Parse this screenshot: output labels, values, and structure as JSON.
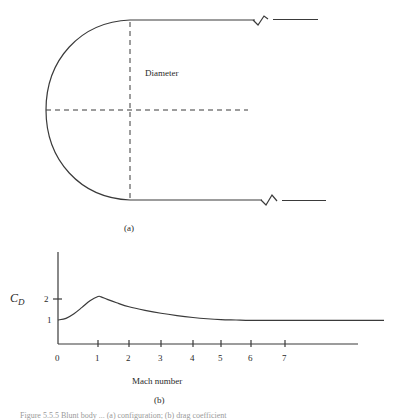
{
  "figure": {
    "panel_a": {
      "label": "(a)",
      "diameter_label": "Diameter",
      "shape": "blunt hemispherical nose cylinder with broken (truncated) afterbody lines"
    },
    "panel_b": {
      "label": "(b)"
    },
    "caption_partial": "Figure 5.5.5 Blunt body ... (a) configuration; (b) drag coefficient"
  },
  "chart_data": {
    "type": "line",
    "title": "",
    "xlabel": "Mach number",
    "ylabel": "C_D",
    "ylabel_main": "C",
    "ylabel_sub": "D",
    "xlim": [
      0,
      10
    ],
    "ylim": [
      0,
      3.2
    ],
    "grid": false,
    "x_ticks": [
      0,
      1,
      2,
      3,
      4,
      5,
      6,
      7
    ],
    "x_tick_labels": [
      "0",
      "1",
      "2",
      "3",
      "4",
      "5",
      "6",
      "7"
    ],
    "y_ticks": [
      1,
      2
    ],
    "y_tick_labels": [
      "1",
      "2"
    ],
    "series": [
      {
        "name": "C_D vs Mach",
        "x": [
          0,
          0.2,
          0.4,
          0.6,
          0.8,
          1.0,
          1.1,
          1.3,
          1.6,
          2.0,
          2.5,
          3.0,
          3.5,
          4.0,
          4.5,
          5.0,
          5.5,
          6.0,
          7.0,
          8.0,
          9.0,
          10.0
        ],
        "y": [
          1.0,
          1.08,
          1.3,
          1.6,
          1.92,
          2.12,
          2.1,
          1.98,
          1.82,
          1.63,
          1.46,
          1.32,
          1.21,
          1.12,
          1.06,
          1.02,
          1.0,
          0.98,
          0.98,
          0.98,
          0.98,
          0.98
        ]
      }
    ]
  }
}
